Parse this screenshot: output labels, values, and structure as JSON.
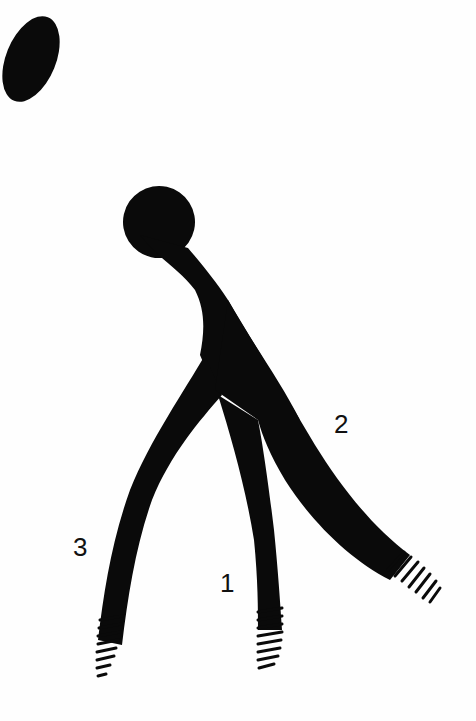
{
  "figure": {
    "ink_color": "#0a0a0a",
    "background_color": "#fefefe",
    "labels": [
      {
        "id": "1",
        "text": "1",
        "x": 220,
        "y": 570
      },
      {
        "id": "2",
        "text": "2",
        "x": 334,
        "y": 411
      },
      {
        "id": "3",
        "text": "3",
        "x": 73,
        "y": 534
      }
    ]
  }
}
